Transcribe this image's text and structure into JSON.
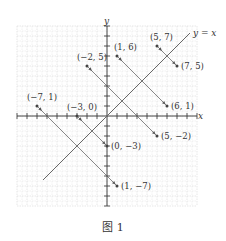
{
  "figure": {
    "caption": "图 1",
    "origin_px": [
      107,
      116
    ],
    "unit_px": 10,
    "grid": {
      "xmin": -9,
      "xmax": 9,
      "ymin": -9,
      "ymax": 9,
      "minor": 2,
      "color": "#d7d7d7"
    },
    "axis_color": "#333333",
    "x_axis_label": "x",
    "y_axis_label": "y",
    "diagonal_line": {
      "label": "y = x",
      "from": [
        -6.4,
        -6.4
      ],
      "to": [
        8.3,
        8.3
      ],
      "color": "#666666"
    },
    "segments": [
      {
        "from": [
          -7,
          1
        ],
        "to": [
          1,
          -7
        ],
        "from_label": "(−7, 1)",
        "to_label": "(1, −7)"
      },
      {
        "from": [
          -3,
          0
        ],
        "to": [
          0,
          -3
        ],
        "from_label": "(−3, 0)",
        "to_label": "(0, −3)"
      },
      {
        "from": [
          -2,
          5
        ],
        "to": [
          5,
          -2
        ],
        "from_label": "(−2, 5)",
        "to_label": "(5, −2)"
      },
      {
        "from": [
          1,
          6
        ],
        "to": [
          6,
          1
        ],
        "from_label": "(1, 6)",
        "to_label": "(6, 1)"
      },
      {
        "from": [
          5,
          7
        ],
        "to": [
          7,
          5
        ],
        "from_label": "(5, 7)",
        "to_label": "(7, 5)"
      }
    ],
    "segment_color": "#555555",
    "point_color": "#444444"
  }
}
